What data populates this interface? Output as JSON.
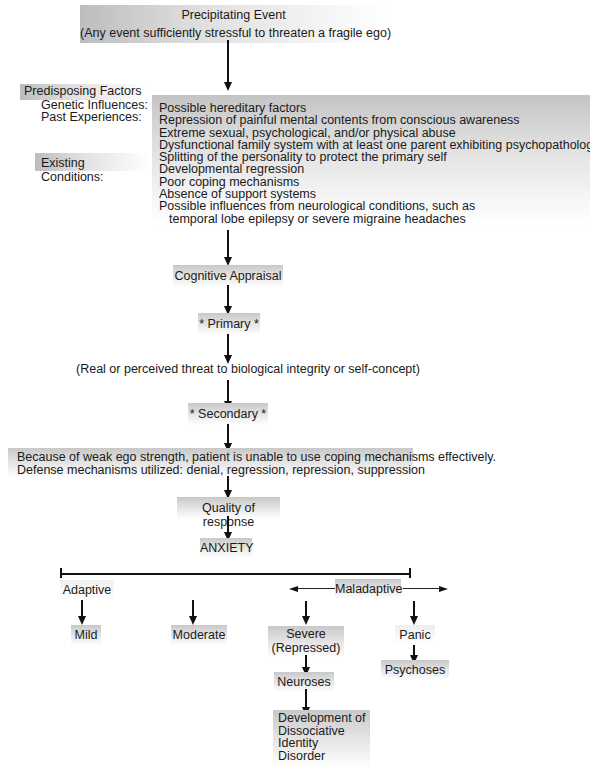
{
  "precipitating_event": {
    "title": "Precipitating Event",
    "subtitle": "(Any event sufficiently stressful to threaten a fragile ego)"
  },
  "predisposing": {
    "heading": "Predisposing Factors",
    "labels": {
      "genetic": "Genetic Influences:",
      "past": "Past Experiences:",
      "existing": "Existing Conditions:"
    },
    "items": [
      "Possible hereditary factors",
      "Repression of painful mental contents from conscious awareness",
      "Extreme sexual, psychological, and/or physical abuse",
      "Dysfunctional family system with at least one parent exhibiting psychopathology",
      "Splitting of the personality to protect the primary self",
      "Developmental regression",
      "Poor coping mechanisms",
      "Absence of support systems",
      "Possible influences from neurological conditions, such as",
      "temporal lobe epilepsy or severe migraine headaches"
    ]
  },
  "appraisal": {
    "cognitive": "Cognitive Appraisal",
    "primary": "* Primary *",
    "threat": "(Real or perceived threat to biological integrity or self-concept)",
    "secondary": "* Secondary *",
    "coping_line1": "Because of weak ego strength, patient is unable to use coping mechanisms effectively.",
    "coping_line2": "Defense mechanisms utilized: denial, regression, repression, suppression",
    "quality": "Quality of response",
    "anxiety": "ANXIETY"
  },
  "continuum": {
    "adaptive": "Adaptive",
    "maladaptive": "Maladaptive",
    "mild": "Mild",
    "moderate": "Moderate",
    "severe_line1": "Severe",
    "severe_line2": "(Repressed)",
    "panic": "Panic",
    "neuroses": "Neuroses",
    "psychoses": "Psychoses",
    "did": [
      "Development of",
      "Dissociative",
      "Identity",
      "Disorder"
    ]
  }
}
